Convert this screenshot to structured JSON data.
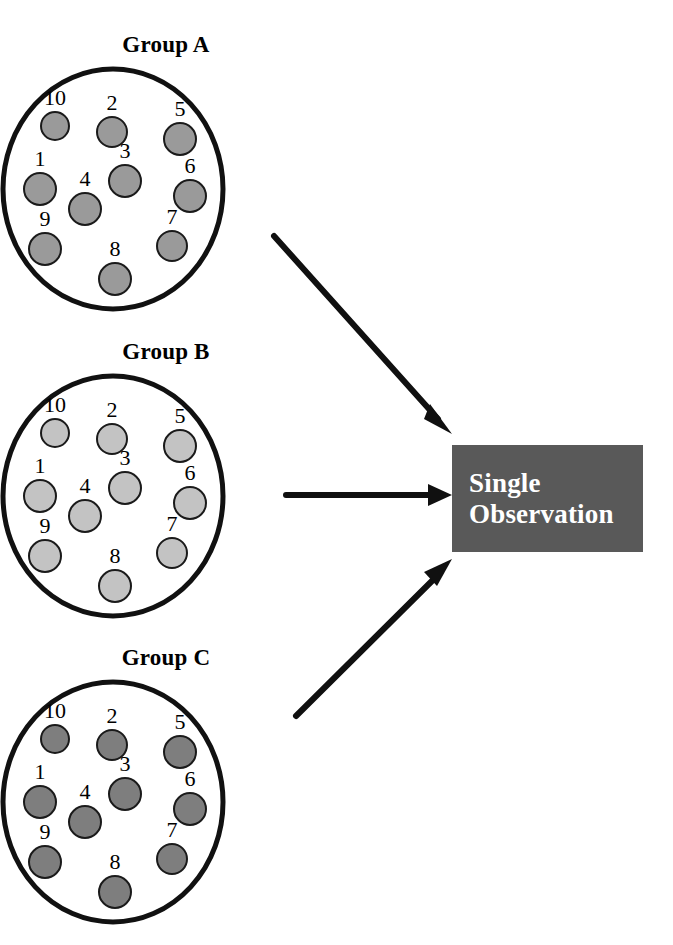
{
  "title": "CROSS-SECTIONAL SAMPLING",
  "colors": {
    "page_background": "#ffffff",
    "outline": "#111111",
    "text": "#000000",
    "arrow": "#101010",
    "box_fill": "#595959",
    "box_text": "#ffffff",
    "dot_outline": "#1a1a1a"
  },
  "groups": [
    {
      "id": "a",
      "label": "Group A",
      "dot_color": "#9a9a9a",
      "dots": [
        {
          "n": "10",
          "x": 55,
          "y": 62,
          "r": 15
        },
        {
          "n": "2",
          "x": 112,
          "y": 68,
          "r": 16
        },
        {
          "n": "5",
          "x": 180,
          "y": 75,
          "r": 17
        },
        {
          "n": "1",
          "x": 40,
          "y": 125,
          "r": 17
        },
        {
          "n": "3",
          "x": 125,
          "y": 117,
          "r": 17
        },
        {
          "n": "6",
          "x": 190,
          "y": 132,
          "r": 17
        },
        {
          "n": "4",
          "x": 85,
          "y": 145,
          "r": 17
        },
        {
          "n": "9",
          "x": 45,
          "y": 185,
          "r": 17
        },
        {
          "n": "7",
          "x": 172,
          "y": 182,
          "r": 16
        },
        {
          "n": "8",
          "x": 115,
          "y": 215,
          "r": 17
        }
      ]
    },
    {
      "id": "b",
      "label": "Group B",
      "dot_color": "#c3c3c3",
      "dots": [
        {
          "n": "10",
          "x": 55,
          "y": 62,
          "r": 15
        },
        {
          "n": "2",
          "x": 112,
          "y": 68,
          "r": 16
        },
        {
          "n": "5",
          "x": 180,
          "y": 75,
          "r": 17
        },
        {
          "n": "1",
          "x": 40,
          "y": 125,
          "r": 17
        },
        {
          "n": "3",
          "x": 125,
          "y": 117,
          "r": 17
        },
        {
          "n": "6",
          "x": 190,
          "y": 132,
          "r": 17
        },
        {
          "n": "4",
          "x": 85,
          "y": 145,
          "r": 17
        },
        {
          "n": "9",
          "x": 45,
          "y": 185,
          "r": 17
        },
        {
          "n": "7",
          "x": 172,
          "y": 182,
          "r": 16
        },
        {
          "n": "8",
          "x": 115,
          "y": 215,
          "r": 17
        }
      ]
    },
    {
      "id": "c",
      "label": "Group C",
      "dot_color": "#7e7e7e",
      "dots": [
        {
          "n": "10",
          "x": 55,
          "y": 62,
          "r": 15
        },
        {
          "n": "2",
          "x": 112,
          "y": 68,
          "r": 16
        },
        {
          "n": "5",
          "x": 180,
          "y": 75,
          "r": 17
        },
        {
          "n": "1",
          "x": 40,
          "y": 125,
          "r": 17
        },
        {
          "n": "3",
          "x": 125,
          "y": 117,
          "r": 17
        },
        {
          "n": "6",
          "x": 190,
          "y": 132,
          "r": 17
        },
        {
          "n": "4",
          "x": 85,
          "y": 145,
          "r": 17
        },
        {
          "n": "9",
          "x": 45,
          "y": 185,
          "r": 17
        },
        {
          "n": "7",
          "x": 172,
          "y": 182,
          "r": 16
        },
        {
          "n": "8",
          "x": 115,
          "y": 215,
          "r": 17
        }
      ]
    }
  ],
  "observation_box": {
    "line1": "Single",
    "line2": "Observation"
  },
  "arrows": [
    {
      "id": "a-to-box",
      "from_group": "Group A",
      "direction": "down-right"
    },
    {
      "id": "b-to-box",
      "from_group": "Group B",
      "direction": "right"
    },
    {
      "id": "c-to-box",
      "from_group": "Group C",
      "direction": "up-right"
    }
  ]
}
